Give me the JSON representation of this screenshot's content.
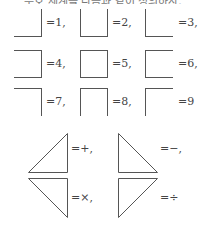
{
  "title_clipped": "부호 체계를 다음과 같이 정의하자.",
  "digits": [
    {
      "value": "1",
      "label": "=1,",
      "sides": [
        "right",
        "bottom"
      ]
    },
    {
      "value": "2",
      "label": "=2,",
      "sides": [
        "left",
        "right",
        "bottom"
      ]
    },
    {
      "value": "3",
      "label": "=3,",
      "sides": [
        "left",
        "bottom"
      ]
    },
    {
      "value": "4",
      "label": "=4,",
      "sides": [
        "top",
        "right",
        "bottom"
      ]
    },
    {
      "value": "5",
      "label": "=5,",
      "sides": [
        "top",
        "right",
        "bottom",
        "left"
      ]
    },
    {
      "value": "6",
      "label": "=6,",
      "sides": [
        "left",
        "top",
        "bottom"
      ]
    },
    {
      "value": "7",
      "label": "=7,",
      "sides": [
        "top",
        "right"
      ]
    },
    {
      "value": "8",
      "label": "=8,",
      "sides": [
        "left",
        "top",
        "right"
      ]
    },
    {
      "value": "9",
      "label": "=9",
      "sides": [
        "left",
        "top"
      ]
    }
  ],
  "operators": [
    {
      "name": "plus",
      "label": "=+,"
    },
    {
      "name": "minus",
      "label": "=−,"
    },
    {
      "name": "times",
      "label": "=×,"
    },
    {
      "name": "divide",
      "label": "=÷"
    }
  ]
}
